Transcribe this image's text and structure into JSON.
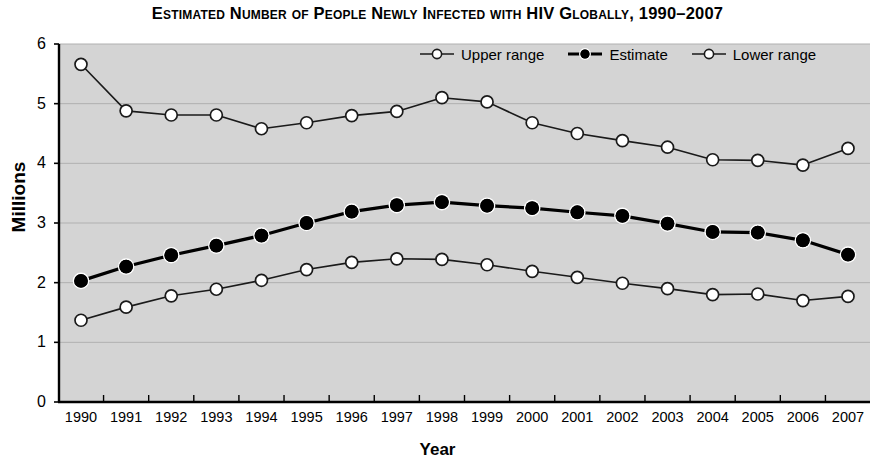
{
  "chart_data": {
    "type": "line",
    "title": "Estimated Number of People Newly Infected with HIV Globally, 1990–2007",
    "xlabel": "Year",
    "ylabel": "Millions",
    "ylim": [
      0,
      6
    ],
    "ytick_labels": [
      "0",
      "1",
      "2",
      "3",
      "4",
      "5",
      "6"
    ],
    "yticks": [
      0,
      1,
      2,
      3,
      4,
      5,
      6
    ],
    "grid": "horizontal",
    "legend_position": "top-right",
    "plot_background": "#d4d4d4",
    "categories": [
      "1990",
      "1991",
      "1992",
      "1993",
      "1994",
      "1995",
      "1996",
      "1997",
      "1998",
      "1999",
      "2000",
      "2001",
      "2002",
      "2003",
      "2004",
      "2005",
      "2006",
      "2007"
    ],
    "x": [
      1990,
      1991,
      1992,
      1993,
      1994,
      1995,
      1996,
      1997,
      1998,
      1999,
      2000,
      2001,
      2002,
      2003,
      2004,
      2005,
      2006,
      2007
    ],
    "series": [
      {
        "name": "Upper range",
        "marker": "open-circle",
        "color": "#1a1a1a",
        "marker_fill": "#ffffff",
        "line_width": 1.6,
        "values": [
          5.66,
          4.88,
          4.81,
          4.81,
          4.58,
          4.68,
          4.8,
          4.87,
          5.1,
          5.03,
          4.68,
          4.5,
          4.38,
          4.27,
          4.06,
          4.05,
          3.97,
          4.25
        ]
      },
      {
        "name": "Estimate",
        "marker": "filled-circle",
        "color": "#000000",
        "marker_fill": "#000000",
        "line_width": 3.2,
        "values": [
          2.03,
          2.27,
          2.46,
          2.62,
          2.79,
          3.0,
          3.19,
          3.3,
          3.35,
          3.29,
          3.25,
          3.18,
          3.12,
          2.99,
          2.85,
          2.84,
          2.71,
          2.47
        ]
      },
      {
        "name": "Lower range",
        "marker": "open-circle",
        "color": "#1a1a1a",
        "marker_fill": "#ffffff",
        "line_width": 1.6,
        "values": [
          1.37,
          1.59,
          1.78,
          1.89,
          2.04,
          2.22,
          2.34,
          2.4,
          2.39,
          2.3,
          2.19,
          2.09,
          1.99,
          1.9,
          1.8,
          1.81,
          1.7,
          1.77
        ]
      }
    ]
  }
}
